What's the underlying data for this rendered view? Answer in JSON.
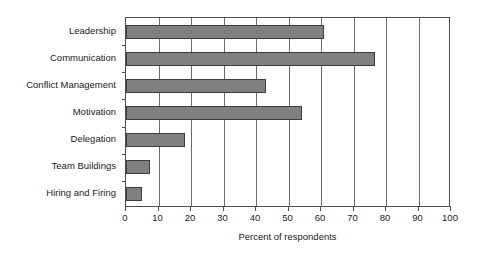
{
  "chart_data": {
    "type": "bar",
    "orientation": "horizontal",
    "title": "",
    "subtitle": "",
    "xlabel": "Percent of respondents",
    "ylabel": "",
    "categories": [
      "Leadership",
      "Communication",
      "Conflict Management",
      "Motivation",
      "Delegation",
      "Team Buildings",
      "Hiring and Firing"
    ],
    "values": [
      61,
      76.5,
      43,
      54,
      18,
      7.5,
      5
    ],
    "series": [
      {
        "name": "Percent of respondents",
        "values": [
          61,
          76.5,
          43,
          54,
          18,
          7.5,
          5
        ]
      }
    ],
    "xlim": [
      0,
      100
    ],
    "xticks": [
      0,
      10,
      20,
      30,
      40,
      50,
      60,
      70,
      80,
      90,
      100
    ],
    "xticklabels": [
      "0",
      "10",
      "20",
      "30",
      "40",
      "50",
      "60",
      "70",
      "80",
      "90",
      "100"
    ],
    "grid": "vertical",
    "legend": "none",
    "bar_color": "#808080",
    "bar_edge_color": "#3d3d3d",
    "axis_color": "#4d4d4d",
    "grid_color": "#6b6b6b",
    "background_color": "#ffffff",
    "text_color": "#1a1a1a"
  }
}
